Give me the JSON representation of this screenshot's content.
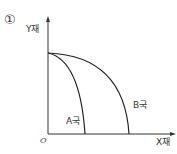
{
  "diagram": {
    "number": "①",
    "y_axis_label": "Y재",
    "x_axis_label": "X재",
    "origin_label": "O",
    "curves": [
      {
        "name": "A국",
        "label": "A국",
        "y_intercept": [
          48,
          53
        ],
        "x_intercept": [
          85,
          134
        ]
      },
      {
        "name": "B국",
        "label": "B국",
        "y_intercept": [
          48,
          53
        ],
        "x_intercept": [
          129,
          134
        ]
      }
    ],
    "colors": {
      "axis": "#333333",
      "curve": "#222222",
      "text": "#333333"
    }
  }
}
